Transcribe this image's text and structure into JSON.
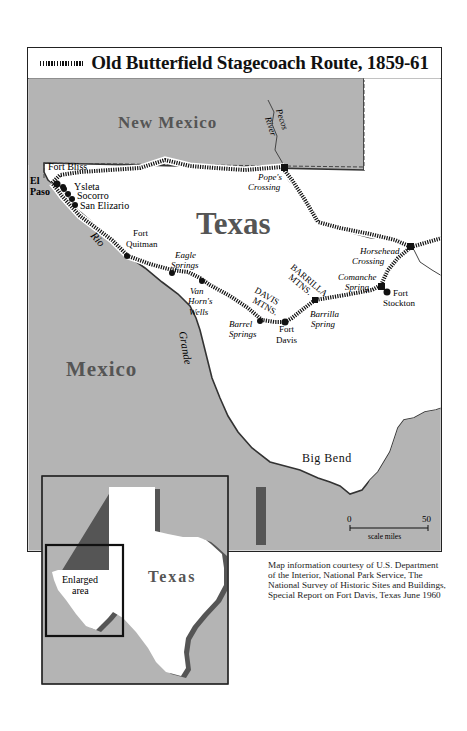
{
  "title": "Old Butterfield Stagecoach Route, 1859-61",
  "legend_icon": "dashed-route-line-icon",
  "regions": {
    "new_mexico": "New Mexico",
    "texas": "Texas",
    "mexico": "Mexico",
    "big_bend": "Big Bend"
  },
  "rivers": {
    "pecos_1": "Pecos",
    "pecos_2": "River",
    "rio": "Rio",
    "grande": "Grande"
  },
  "mountains": {
    "davis_1": "DAVIS",
    "davis_2": "MTNS.",
    "barrilla_1": "BARRILLA",
    "barrilla_2": "MTNS."
  },
  "places": {
    "fort_bliss": "Fort Bliss",
    "el": "El",
    "paso": "Paso",
    "ysleta": "Ysleta",
    "socorro": "Socorro",
    "san_elizario": "San Elizario",
    "fort_quitman_1": "Fort",
    "fort_quitman_2": "Quitman",
    "eagle_springs_1": "Eagle",
    "eagle_springs_2": "Springs",
    "van_horns_1": "Van",
    "van_horns_2": "Horn's",
    "van_horns_3": "Wells",
    "barrel_springs_1": "Barrel",
    "barrel_springs_2": "Springs",
    "fort_davis_1": "Fort",
    "fort_davis_2": "Davis",
    "barrilla_spring_1": "Barrilla",
    "barrilla_spring_2": "Spring",
    "popes_crossing_1": "Pope's",
    "popes_crossing_2": "Crossing",
    "horsehead_1": "Horsehead",
    "horsehead_2": "Crossing",
    "comanche_1": "Comanche",
    "comanche_2": "Spring",
    "fort_stockton_1": "Fort",
    "fort_stockton_2": "Stockton"
  },
  "scale": {
    "min": "0",
    "max": "50",
    "label": "scale miles"
  },
  "inset": {
    "state_label": "Texas",
    "enlarged_1": "Enlarged",
    "enlarged_2": "area"
  },
  "credit": "Map information courtesy of U.S. Department of the Interior, National Park Service, The National Survey of Historic Sites and Buildings, Special Report on Fort Davis, Texas June 1960",
  "colors": {
    "land_gray": "#b4b4b4",
    "texas_white": "#ffffff",
    "route_black": "#111111",
    "border": "#222222",
    "shadow": "#6a6a6a"
  }
}
